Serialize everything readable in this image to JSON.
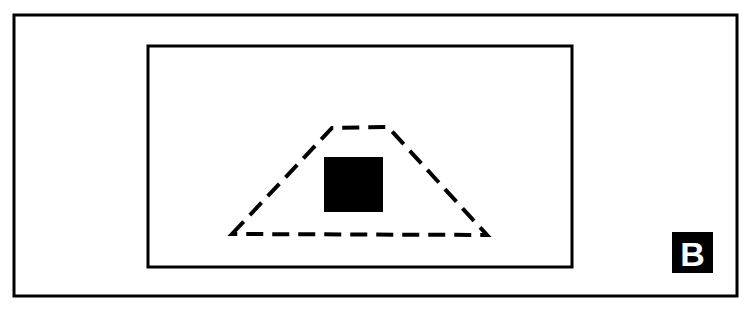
{
  "figure": {
    "panel_label": "B",
    "caption_visible_text": "",
    "background_color": "#ffffff",
    "stroke_color": "#000000"
  },
  "elements": {
    "outer_frame": {
      "name": "outer-frame-rectangle",
      "style": "solid",
      "x": 14,
      "y": 15,
      "width": 723,
      "height": 281,
      "stroke_width": 3,
      "color": "#000000",
      "fill": "none"
    },
    "inner_frame": {
      "name": "inner-frame-rectangle",
      "style": "solid",
      "x": 148,
      "y": 46,
      "width": 424,
      "height": 221,
      "stroke_width": 3,
      "color": "#000000",
      "fill": "none"
    },
    "dashed_trapezoid": {
      "name": "dashed-trapezoid",
      "style": "dashed",
      "stroke_width": 4,
      "color": "#000000",
      "fill": "none",
      "dash_length": 17,
      "gap_length": 9,
      "points": [
        {
          "label": "bottom-left",
          "x": 232,
          "y": 234
        },
        {
          "label": "top-left",
          "x": 332,
          "y": 128
        },
        {
          "label": "top-right",
          "x": 388,
          "y": 127
        },
        {
          "label": "bottom-right",
          "x": 487,
          "y": 235
        }
      ]
    },
    "filled_square": {
      "name": "black-filled-square",
      "style": "filled",
      "x": 324,
      "y": 157,
      "width": 59,
      "height": 55,
      "color": "#000000"
    },
    "panel_badge": {
      "name": "panel-label-badge",
      "x": 672,
      "y": 232,
      "width": 41,
      "height": 41,
      "background_color": "#000000",
      "text_color": "#ffffff",
      "text": "B"
    }
  }
}
